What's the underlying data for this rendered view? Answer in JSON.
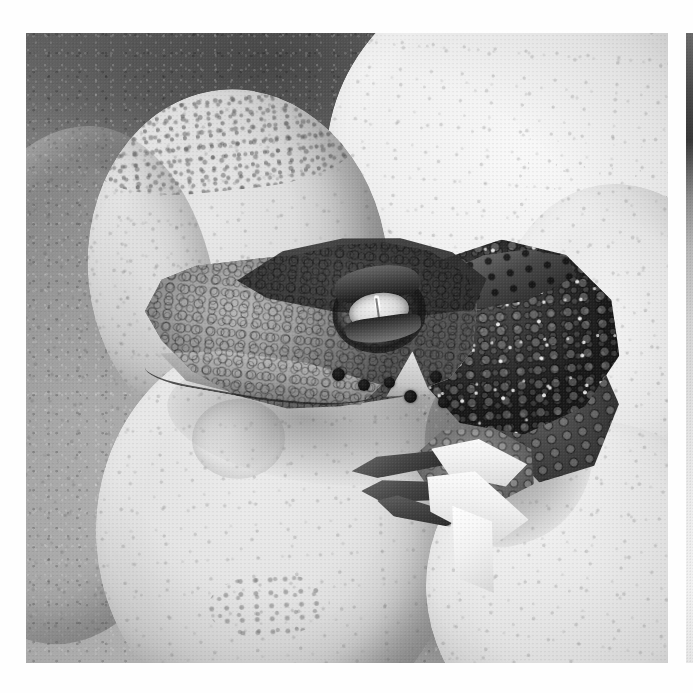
{
  "page": {
    "background_color": "#fefefe",
    "kind": "photograph-plate-on-white-page"
  },
  "photo": {
    "title": "Crocodile hatchling emerging from egg in nest",
    "medium": "black-and-white photograph",
    "palette": {
      "paper": "#fefefe",
      "sand_dark": "#4a4845",
      "sand_light": "#bcbab5",
      "egg_bright": "#f4f3ef",
      "egg_mid": "#dcdad4",
      "egg_shadow": "#9d9b95",
      "hatchling_dark": "#201d1a",
      "hatchling_mid": "#6e6a62",
      "hatchling_light": "#bab6ac",
      "eye_iris": "#efece4",
      "pupil_highlight": "#ffffff"
    },
    "frame": {
      "left": 26,
      "top": 33,
      "width": 642,
      "height": 630
    },
    "subjects": [
      {
        "name": "hatchling-head",
        "description": "scaly crocodilian head in profile facing left with elongated snout"
      },
      {
        "name": "hatchling-eye",
        "description": "pale iris with vertical slit pupil and bright highlight"
      },
      {
        "name": "hatchling-forelimb",
        "description": "clawed forelimb with three visible toes below the jaw"
      },
      {
        "name": "hatchling-neck",
        "description": "dark keeled nape scales behind the head"
      },
      {
        "name": "broken-eggshell",
        "description": "cracked white shell fragments beside the hatchling"
      },
      {
        "name": "nest-eggs",
        "description": "six smooth pale eggs packed around the hatchling"
      },
      {
        "name": "nest-substrate",
        "description": "dark damp sand and nesting debris"
      }
    ],
    "eggs": [
      {
        "id": "egg-top-left",
        "tone": "pale, grit-flecked crown"
      },
      {
        "id": "egg-top-right",
        "tone": "brightest, smooth highlight"
      },
      {
        "id": "egg-left-lower",
        "tone": "mid grey, strong side shadow"
      },
      {
        "id": "egg-bottom-center",
        "tone": "pale with dimple and stain"
      },
      {
        "id": "egg-bottom-right",
        "tone": "bright, lightly speckled"
      },
      {
        "id": "egg-right-mid",
        "tone": "cracked shell behind hatchling"
      }
    ],
    "jaw_spots_count": 6,
    "shell_flakes_count": 6,
    "toes_count": 3
  },
  "right_sliver": {
    "name": "adjacent-image-edge",
    "description": "thin vertical strip of a neighbouring photograph at the page edge, dark at top fading to near white"
  }
}
